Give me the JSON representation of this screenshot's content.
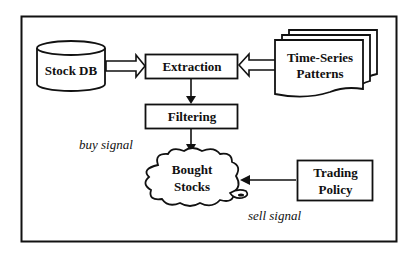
{
  "diagram": {
    "nodes": {
      "stock_db": {
        "label": "Stock DB",
        "shape": "cylinder"
      },
      "extraction": {
        "label": "Extraction",
        "shape": "rectangle"
      },
      "time_series": {
        "line1": "Time-Series",
        "line2": "Patterns",
        "shape": "multi-document"
      },
      "filtering": {
        "label": "Filtering",
        "shape": "rectangle"
      },
      "bought_stocks": {
        "line1": "Bought",
        "line2": "Stocks",
        "shape": "cloud"
      },
      "trading_policy": {
        "line1": "Trading",
        "line2": "Policy",
        "shape": "rectangle"
      }
    },
    "annotations": {
      "buy_signal": "buy signal",
      "sell_signal": "sell signal"
    },
    "edges": [
      {
        "from": "stock_db",
        "to": "extraction",
        "style": "hollow-block-arrow"
      },
      {
        "from": "time_series",
        "to": "extraction",
        "style": "hollow-block-arrow"
      },
      {
        "from": "extraction",
        "to": "filtering",
        "style": "solid-arrow"
      },
      {
        "from": "filtering",
        "to": "bought_stocks",
        "style": "solid-arrow"
      },
      {
        "from": "trading_policy",
        "to": "bought_stocks",
        "style": "solid-arrow"
      }
    ]
  }
}
